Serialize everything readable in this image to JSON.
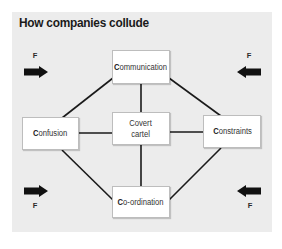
{
  "title": "How companies collude",
  "colors": {
    "panel_background": "#ececec",
    "box_background": "#ffffff",
    "line_color": "#1a1a1a",
    "arrow_color": "#111111"
  },
  "nodes": {
    "center": {
      "line1": "Covert",
      "line2": "cartel"
    },
    "top": {
      "first": "C",
      "rest": "ommunication"
    },
    "left": {
      "first": "C",
      "rest": "onfusion"
    },
    "right": {
      "first": "C",
      "rest": "onstraints"
    },
    "bottom": {
      "first": "C",
      "rest": "o-ordination"
    }
  },
  "forces": {
    "top_left": {
      "label": "F",
      "direction": "right"
    },
    "top_right": {
      "label": "F",
      "direction": "left"
    },
    "bottom_left": {
      "label": "F",
      "direction": "right"
    },
    "bottom_right": {
      "label": "F",
      "direction": "left"
    }
  }
}
